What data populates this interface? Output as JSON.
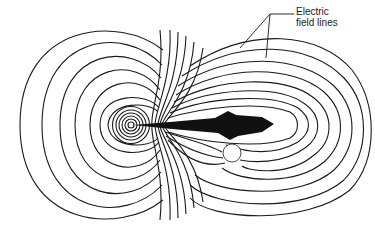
{
  "figure": {
    "annotation": {
      "line1": "Electric",
      "line2": "field lines"
    },
    "colors": {
      "line": "#1a1a1a",
      "background": "#ffffff",
      "fish": "#111111"
    }
  }
}
